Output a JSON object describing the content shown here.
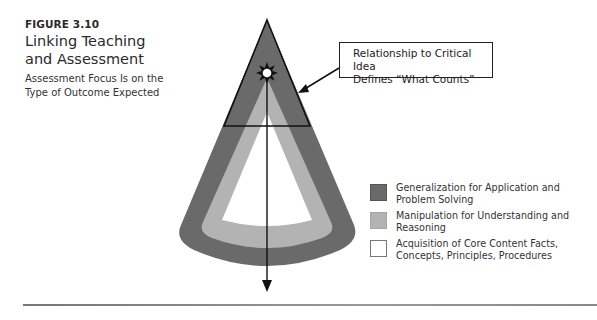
{
  "figure": {
    "label": "FIGURE 3.10",
    "title_line1": "Linking Teaching",
    "title_line2": "and Assessment",
    "subtitle_line1": "Assessment Focus Is on the",
    "subtitle_line2": "Type of Outcome Expected"
  },
  "callout": {
    "line1": "Relationship to Critical Idea",
    "line2": "Defines “What Counts”"
  },
  "legend": {
    "items": [
      {
        "line1": "Generalization for Application and",
        "line2": "Problem Solving",
        "color": "#6a6a6a"
      },
      {
        "line1": "Manipulation for Understanding and",
        "line2": "Reasoning",
        "color": "#b3b3b3"
      },
      {
        "line1": "Acquisition of Core Content Facts,",
        "line2": "Concepts, Principles, Procedures",
        "color": "#ffffff"
      }
    ]
  },
  "colors": {
    "outer_band": "#6a6a6a",
    "middle_band": "#b3b3b3",
    "inner_core": "#ffffff",
    "lines": "#111111"
  },
  "icons": {
    "critical_idea": "sun-burst-icon",
    "downward_arrow": "arrow-down-icon",
    "pointer_arrow": "arrow-pointer-icon"
  }
}
